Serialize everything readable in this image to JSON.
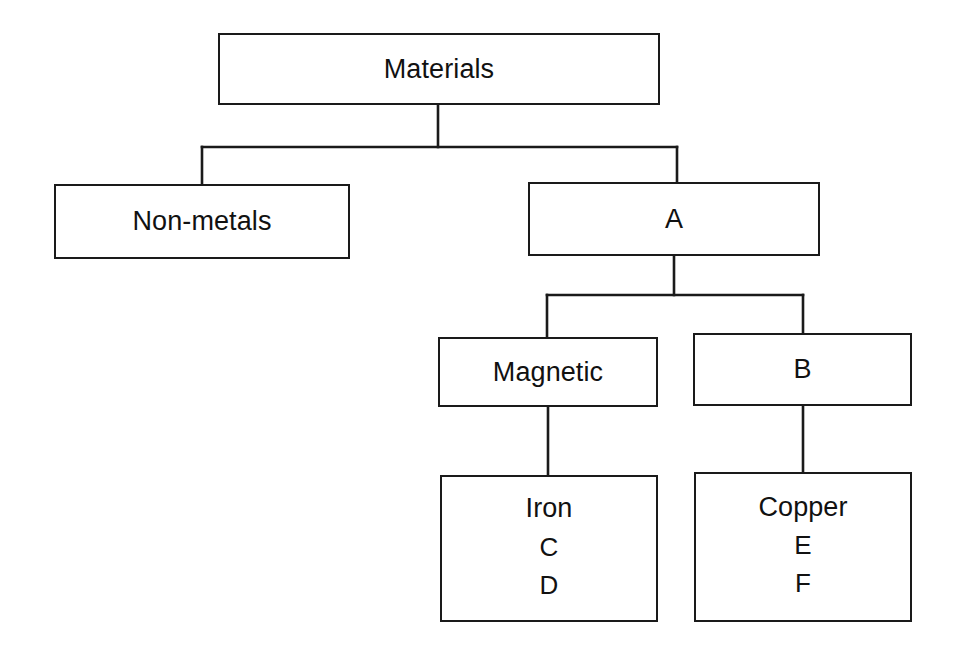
{
  "diagram": {
    "type": "tree-diagram",
    "background_color": "#ffffff",
    "line_color": "#1a1a1a",
    "text_color": "#111111"
  },
  "nodes": {
    "materials": {
      "label": "Materials"
    },
    "nonmetals": {
      "label": "Non-metals"
    },
    "a": {
      "label": "A"
    },
    "magnetic": {
      "label": "Magnetic"
    },
    "b": {
      "label": "B"
    },
    "iron": {
      "label": "Iron",
      "line2": "C",
      "line3": "D"
    },
    "copper": {
      "label": "Copper",
      "line2": "E",
      "line3": "F"
    }
  },
  "edges": [
    {
      "from": "materials",
      "to": "nonmetals"
    },
    {
      "from": "materials",
      "to": "a"
    },
    {
      "from": "a",
      "to": "magnetic"
    },
    {
      "from": "a",
      "to": "b"
    },
    {
      "from": "magnetic",
      "to": "iron"
    },
    {
      "from": "b",
      "to": "copper"
    }
  ]
}
